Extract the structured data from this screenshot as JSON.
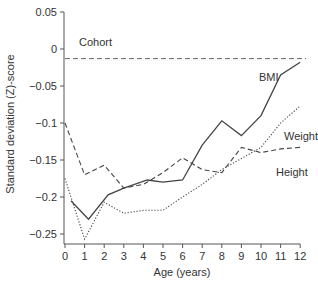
{
  "chart_data": {
    "type": "line",
    "title": "",
    "xlabel": "Age (years)",
    "ylabel": "Standard deviation (Z)-score",
    "xlim": [
      0,
      12
    ],
    "ylim": [
      -0.26,
      0.05
    ],
    "x_ticks": [
      "0",
      "1",
      "2",
      "3",
      "4",
      "5",
      "6",
      "7",
      "8",
      "9",
      "10",
      "11",
      "12"
    ],
    "y_ticks": [
      "0.05",
      "0",
      "-0.05",
      "-0.1",
      "-0.15",
      "-0.2",
      "-0.25"
    ],
    "grid": false,
    "legend_position": "inline labels",
    "series": [
      {
        "name": "Cohort",
        "style": "dashed",
        "x": [
          0,
          12
        ],
        "values": [
          -0.013,
          -0.013
        ]
      },
      {
        "name": "BMI",
        "style": "solid",
        "x": [
          0.3,
          1.2,
          2.2,
          3,
          4.2,
          5,
          6,
          7,
          8,
          9,
          10,
          11,
          12
        ],
        "values": [
          -0.205,
          -0.23,
          -0.197,
          -0.188,
          -0.177,
          -0.18,
          -0.177,
          -0.13,
          -0.097,
          -0.117,
          -0.09,
          -0.035,
          -0.018
        ]
      },
      {
        "name": "Height",
        "style": "dashed",
        "x": [
          0,
          1,
          2,
          3,
          4,
          5,
          6,
          7,
          8,
          9,
          10,
          11,
          12
        ],
        "values": [
          -0.1,
          -0.17,
          -0.157,
          -0.188,
          -0.183,
          -0.167,
          -0.147,
          -0.163,
          -0.167,
          -0.133,
          -0.14,
          -0.135,
          -0.133
        ]
      },
      {
        "name": "Weight",
        "style": "dotted",
        "x": [
          0,
          1,
          2,
          3,
          4,
          5,
          6,
          7,
          8,
          9,
          10,
          11,
          12
        ],
        "values": [
          -0.175,
          -0.257,
          -0.207,
          -0.222,
          -0.218,
          -0.218,
          -0.2,
          -0.183,
          -0.163,
          -0.148,
          -0.133,
          -0.1,
          -0.077
        ]
      }
    ],
    "annotations": [
      "Cohort",
      "BMI",
      "Weight",
      "Height"
    ]
  }
}
